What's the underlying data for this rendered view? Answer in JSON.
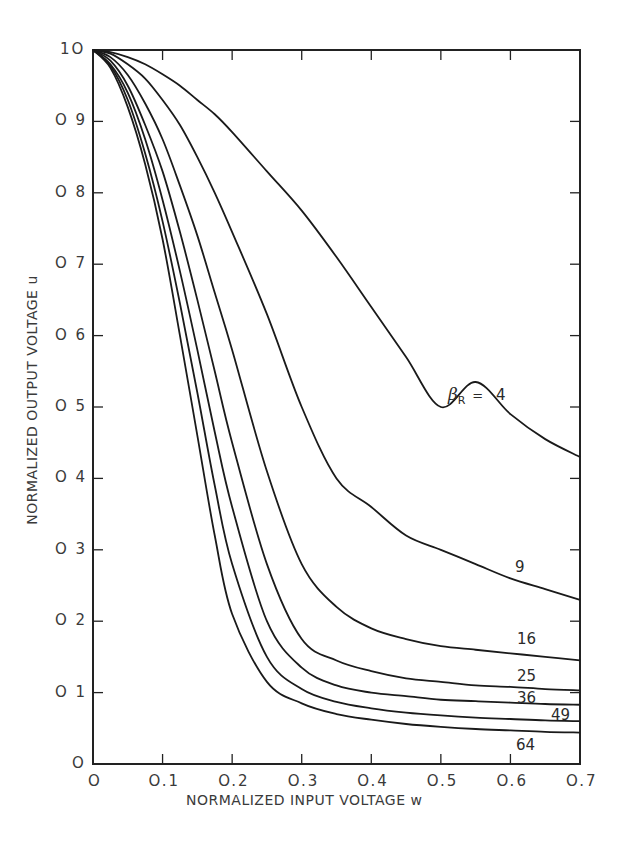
{
  "chart_data": {
    "type": "line",
    "title": "",
    "xlabel": "NORMALIZED INPUT VOLTAGE w",
    "ylabel": "NORMALIZED OUTPUT VOLTAGE u",
    "xlim": [
      0,
      0.7
    ],
    "ylim": [
      0,
      1.0
    ],
    "grid": false,
    "legend_position": "inline curve labels",
    "x_ticks": [
      "0",
      "0.1",
      "0.2",
      "0.3",
      "0.4",
      "0.5",
      "0.6",
      "0.7"
    ],
    "y_ticks": [
      "0",
      "0.1",
      "0.2",
      "0.3",
      "0.4",
      "0.5",
      "0.6",
      "0.7",
      "0.8",
      "0.9",
      "1.0"
    ],
    "parameter_label": "βR =",
    "x": [
      0,
      0.025,
      0.05,
      0.075,
      0.1,
      0.125,
      0.15,
      0.175,
      0.2,
      0.25,
      0.3,
      0.35,
      0.4,
      0.45,
      0.5,
      0.55,
      0.6,
      0.65,
      0.7
    ],
    "series": [
      {
        "name": "4",
        "values": [
          1.0,
          0.997,
          0.99,
          0.98,
          0.966,
          0.95,
          0.93,
          0.91,
          0.885,
          0.83,
          0.775,
          0.71,
          0.64,
          0.57,
          0.5,
          0.535,
          0.49,
          0.455,
          0.43
        ]
      },
      {
        "name": "9",
        "values": [
          1.0,
          0.995,
          0.98,
          0.96,
          0.93,
          0.895,
          0.85,
          0.8,
          0.745,
          0.63,
          0.5,
          0.4,
          0.36,
          0.32,
          0.3,
          0.28,
          0.26,
          0.245,
          0.23
        ]
      },
      {
        "name": "16",
        "values": [
          1.0,
          0.99,
          0.965,
          0.925,
          0.875,
          0.81,
          0.74,
          0.66,
          0.58,
          0.41,
          0.28,
          0.22,
          0.19,
          0.175,
          0.165,
          0.16,
          0.155,
          0.15,
          0.145
        ]
      },
      {
        "name": "25",
        "values": [
          1.0,
          0.985,
          0.95,
          0.895,
          0.83,
          0.745,
          0.65,
          0.55,
          0.45,
          0.28,
          0.175,
          0.145,
          0.13,
          0.12,
          0.115,
          0.11,
          0.108,
          0.105,
          0.103
        ]
      },
      {
        "name": "36",
        "values": [
          1.0,
          0.98,
          0.94,
          0.875,
          0.79,
          0.69,
          0.58,
          0.465,
          0.36,
          0.2,
          0.135,
          0.11,
          0.1,
          0.095,
          0.09,
          0.088,
          0.086,
          0.084,
          0.083
        ]
      },
      {
        "name": "49",
        "values": [
          1.0,
          0.978,
          0.93,
          0.855,
          0.76,
          0.645,
          0.52,
          0.39,
          0.28,
          0.15,
          0.105,
          0.087,
          0.078,
          0.072,
          0.068,
          0.065,
          0.063,
          0.061,
          0.06
        ]
      },
      {
        "name": "64",
        "values": [
          1.0,
          0.975,
          0.92,
          0.84,
          0.735,
          0.6,
          0.46,
          0.32,
          0.21,
          0.115,
          0.085,
          0.07,
          0.062,
          0.056,
          0.052,
          0.049,
          0.047,
          0.045,
          0.044
        ]
      }
    ]
  },
  "labels": {
    "param_prefix": "β",
    "param_sub": "R",
    "param_eq": "=",
    "curve_4": "4",
    "curve_9": "9",
    "curve_16": "16",
    "curve_25": "25",
    "curve_36": "36",
    "curve_49": "49",
    "curve_64": "64"
  },
  "style": {
    "line_color": "#1a1a1a",
    "frame_color": "#222222",
    "background": "#ffffff"
  }
}
